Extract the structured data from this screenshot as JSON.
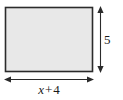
{
  "figure": {
    "type": "geometry-diagram",
    "shape": "rectangle",
    "title": "",
    "fill_color": "#e8e8e8",
    "stroke_color": "#2b2b2b",
    "dimension_line_color": "#2b2b2b",
    "background_color": "#ffffff",
    "rectangle": {
      "x": 5,
      "y": 7,
      "width": 88,
      "height": 65
    },
    "dimensions": {
      "width": {
        "label": "x + 4",
        "variable": "x",
        "operator": "+",
        "constant": "4",
        "position": "bottom",
        "line_y": 79,
        "line_x1": 5,
        "line_x2": 93
      },
      "height": {
        "label": "5",
        "value": "5",
        "position": "right",
        "line_x": 100,
        "line_y1": 7,
        "line_y2": 72
      }
    },
    "icons": {
      "arrow_left": "arrow-left-icon",
      "arrow_right": "arrow-right-icon",
      "arrow_up": "arrow-up-icon",
      "arrow_down": "arrow-down-icon"
    }
  }
}
